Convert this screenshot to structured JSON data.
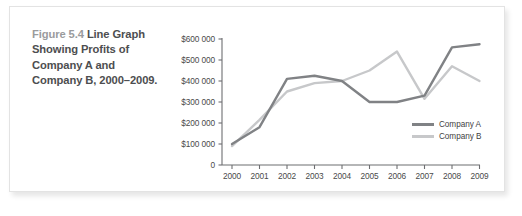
{
  "figure": {
    "number": "Figure 5.4",
    "title": "Line Graph Showing Profits of Company A and Company B, 2000–2009."
  },
  "colors": {
    "series_a": "#808285",
    "series_b": "#c7c8ca",
    "axis": "#6d6e71",
    "caption_number": "#9a9b9d",
    "caption_title": "#4d4e50",
    "card_background": "#ffffff",
    "card_border": "#e3e3e3"
  },
  "chart_data": {
    "type": "line",
    "title": "",
    "xlabel": "",
    "ylabel": "",
    "categories": [
      "2000",
      "2001",
      "2002",
      "2003",
      "2004",
      "2005",
      "2006",
      "2007",
      "2008",
      "2009"
    ],
    "series": [
      {
        "name": "Company A",
        "color": "#808285",
        "values": [
          100000,
          180000,
          410000,
          425000,
          400000,
          300000,
          300000,
          330000,
          560000,
          575000
        ]
      },
      {
        "name": "Company B",
        "color": "#c7c8ca",
        "values": [
          90000,
          215000,
          350000,
          390000,
          400000,
          450000,
          540000,
          315000,
          470000,
          400000
        ]
      }
    ],
    "ylim": [
      0,
      600000
    ],
    "ytick_values": [
      0,
      100000,
      200000,
      300000,
      400000,
      500000,
      600000
    ],
    "ytick_labels": [
      "0",
      "$100 000",
      "$200 000",
      "$300 000",
      "$400 000",
      "$500 000",
      "$600 000"
    ],
    "xtick_labels": [
      "2000",
      "2001",
      "2002",
      "2003",
      "2004",
      "2005",
      "2006",
      "2007",
      "2008",
      "2009"
    ],
    "grid": false,
    "legend_position": "inside-bottom-right",
    "legend_entries": [
      "Company A",
      "Company B"
    ]
  }
}
